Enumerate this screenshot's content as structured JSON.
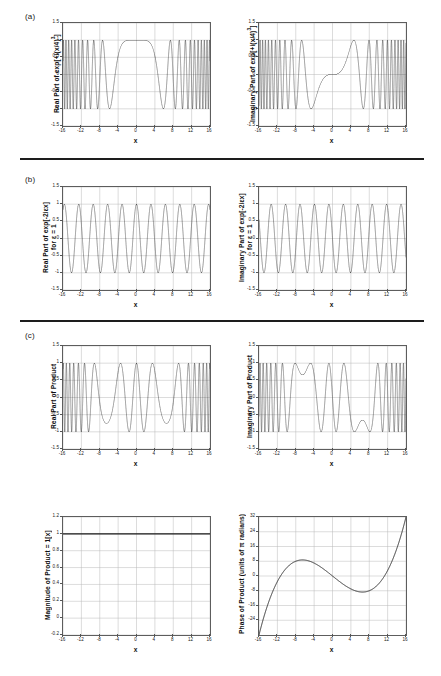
{
  "figure": {
    "panels": [
      {
        "letter": "(a)"
      },
      {
        "letter": "(b)"
      },
      {
        "letter": "(c)"
      }
    ],
    "xlabel": "x",
    "xticks": [
      "-16",
      "-12",
      "-8",
      "-4",
      "0",
      "4",
      "8",
      "12",
      "16"
    ],
    "yticks_unit": [
      "1.5",
      "1",
      "0.5",
      "0",
      "-0.5",
      "-1",
      "-1.5"
    ],
    "yticks_mag": [
      "1.2",
      "1",
      "0.8",
      "0.6",
      "0.4",
      "0.2",
      "0",
      "-0.2"
    ],
    "yticks_phase": [
      "32",
      "24",
      "16",
      "8",
      "0",
      "-8",
      "-16",
      "-24"
    ],
    "labels": {
      "a_real": "Real Part of exp[+i(x/4)",
      "a_real_sup": "3",
      "a_real_tail": "]",
      "a_imag": "Imaginary Part of exp[+i(x/4)",
      "a_imag_sup": "3",
      "a_imag_tail": "]",
      "b_real_l1": "Real Part of exp[-2iεx]",
      "b_real_l2": "for ε = 1",
      "b_imag_l1": "Imaginary Part of exp[-2iεx]",
      "b_imag_l2": "for ε = 1",
      "c_real": "Real Part of Product",
      "c_imag": "Imaginary Part of Product",
      "mag": "Magnitude of Product = 1[x]",
      "phase": "Phase of Product (units of π radians)"
    },
    "colors": {
      "curve": "#1a1a1a",
      "grid": "#b9b9b9",
      "axis": "#5d5d5d",
      "rule": "#1d1d1d"
    }
  },
  "chart_data": [
    {
      "type": "line",
      "id": "a-real",
      "title": "Real Part of exp[+i(x/4)^3]",
      "xlabel": "x",
      "ylabel": "Real Part of exp[+i(x/4)^3]",
      "expr": "cos((x/4)^3)",
      "xlim": [
        -16,
        16
      ],
      "ylim": [
        -1.5,
        1.5
      ],
      "xticks": [
        -16,
        -12,
        -8,
        -4,
        0,
        4,
        8,
        12,
        16
      ],
      "yticks": [
        1.5,
        1,
        0.5,
        0,
        -0.5,
        -1,
        -1.5
      ],
      "grid": true,
      "legend": "none",
      "notes": "Chirped cosine; flat plateau near x=0 widening to dense oscillation toward |x|=16"
    },
    {
      "type": "line",
      "id": "a-imag",
      "title": "Imaginary Part of exp[+i(x/4)^3]",
      "xlabel": "x",
      "ylabel": "Imaginary Part of exp[+i(x/4)^3]",
      "expr": "sin((x/4)^3)",
      "xlim": [
        -16,
        16
      ],
      "ylim": [
        -1.5,
        1.5
      ],
      "xticks": [
        -16,
        -12,
        -8,
        -4,
        0,
        4,
        8,
        12,
        16
      ],
      "yticks": [
        1.5,
        1,
        0.5,
        0,
        -0.5,
        -1,
        -1.5
      ],
      "grid": true,
      "legend": "none",
      "notes": "Odd chirped sine passing through origin"
    },
    {
      "type": "line",
      "id": "b-real",
      "title": "Real Part of exp[-2iεx] for ε = 1",
      "xlabel": "x",
      "ylabel": "Real Part of exp[-2iεx] for ε = 1",
      "expr": "cos(2x)",
      "xlim": [
        -16,
        16
      ],
      "ylim": [
        -1.5,
        1.5
      ],
      "xticks": [
        -16,
        -12,
        -8,
        -4,
        0,
        4,
        8,
        12,
        16
      ],
      "yticks": [
        1.5,
        1,
        0.5,
        0,
        -0.5,
        -1,
        -1.5
      ],
      "grid": true,
      "legend": "none",
      "notes": "Uniform period-π oscillation across full range"
    },
    {
      "type": "line",
      "id": "b-imag",
      "title": "Imaginary Part of exp[-2iεx] for ε = 1",
      "xlabel": "x",
      "ylabel": "Imaginary Part of exp[-2iεx] for ε = 1",
      "expr": "-sin(2x)",
      "xlim": [
        -16,
        16
      ],
      "ylim": [
        -1.5,
        1.5
      ],
      "xticks": [
        -16,
        -12,
        -8,
        -4,
        0,
        4,
        8,
        12,
        16
      ],
      "yticks": [
        1.5,
        1,
        0.5,
        0,
        -0.5,
        -1,
        -1.5
      ],
      "grid": true,
      "legend": "none",
      "notes": "Uniform period-π oscillation across full range"
    },
    {
      "type": "line",
      "id": "c-real",
      "title": "Real Part of Product",
      "xlabel": "x",
      "ylabel": "Real Part of Product",
      "expr": "cos((x/4)^3 - 2x)",
      "xlim": [
        -16,
        16
      ],
      "ylim": [
        -1.5,
        1.5
      ],
      "xticks": [
        -16,
        -12,
        -8,
        -4,
        0,
        4,
        8,
        12,
        16
      ],
      "yticks": [
        1.5,
        1,
        0.5,
        0,
        -0.5,
        -1,
        -1.5
      ],
      "grid": true,
      "legend": "none",
      "notes": "Stationary-phase slow regions near x=-5.7 and x=+5.7"
    },
    {
      "type": "line",
      "id": "c-imag",
      "title": "Imaginary Part of Product",
      "xlabel": "x",
      "ylabel": "Imaginary Part of Product",
      "expr": "sin((x/4)^3 - 2x)",
      "xlim": [
        -16,
        16
      ],
      "ylim": [
        -1.5,
        1.5
      ],
      "xticks": [
        -16,
        -12,
        -8,
        -4,
        0,
        4,
        8,
        12,
        16
      ],
      "yticks": [
        1.5,
        1,
        0.5,
        0,
        -0.5,
        -1,
        -1.5
      ],
      "grid": true,
      "legend": "none",
      "notes": "Stationary-phase slow regions near x=-5.7 and x=+5.7"
    },
    {
      "type": "line",
      "id": "magnitude",
      "title": "Magnitude of Product = 1[x]",
      "xlabel": "x",
      "ylabel": "Magnitude of Product = 1[x]",
      "expr": "1",
      "xlim": [
        -16,
        16
      ],
      "ylim": [
        -0.2,
        1.2
      ],
      "xticks": [
        -16,
        -12,
        -8,
        -4,
        0,
        4,
        8,
        12,
        16
      ],
      "yticks": [
        1.2,
        1,
        0.8,
        0.6,
        0.4,
        0.2,
        0,
        -0.2
      ],
      "grid": true,
      "legend": "none",
      "values": [
        1,
        1,
        1,
        1,
        1,
        1,
        1,
        1,
        1
      ],
      "notes": "Constant unit magnitude"
    },
    {
      "type": "line",
      "id": "phase",
      "title": "Phase of Product (units of π radians)",
      "xlabel": "x",
      "ylabel": "Phase of Product (units of π radians)",
      "expr": "(x/4)^3 - 2x",
      "xlim": [
        -16,
        16
      ],
      "ylim": [
        -32,
        32
      ],
      "xticks": [
        -16,
        -12,
        -8,
        -4,
        0,
        4,
        8,
        12,
        16
      ],
      "yticks": [
        32,
        24,
        16,
        8,
        0,
        -8,
        -16,
        -24
      ],
      "grid": true,
      "legend": "none",
      "x": [
        -16,
        -12,
        -8,
        -5.66,
        -4,
        0,
        4,
        5.66,
        8,
        12,
        16
      ],
      "values": [
        -32,
        -3,
        8,
        7.5,
        7,
        0,
        -7,
        -7.5,
        -8,
        3,
        32
      ],
      "notes": "Cubic with local max near x=-5.7 and local min near x=+5.7"
    }
  ]
}
